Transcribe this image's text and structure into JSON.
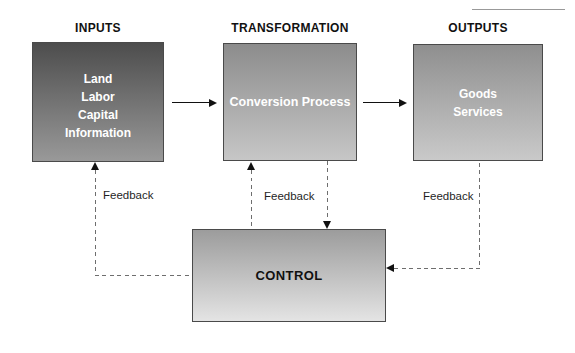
{
  "headers": {
    "inputs": "INPUTS",
    "transformation": "TRANSFORMATION",
    "outputs": "OUTPUTS"
  },
  "boxes": {
    "inputs": {
      "lines": [
        "Land",
        "Labor",
        "Capital",
        "Information"
      ]
    },
    "transformation": {
      "label": "Conversion Process"
    },
    "outputs": {
      "lines": [
        "Goods",
        "Services"
      ]
    },
    "control": {
      "label": "CONTROL"
    }
  },
  "feedback_labels": {
    "inputs": "Feedback",
    "transformation": "Feedback",
    "outputs": "Feedback"
  },
  "colors": {
    "page_bg": "#ffffff",
    "inputs_box_top": "#4d4d4d",
    "inputs_box_bottom": "#999999",
    "transformation_box_top": "#8c8c8c",
    "transformation_box_bottom": "#c6c6c6",
    "outputs_box_top": "#8f8f8f",
    "outputs_box_bottom": "#c9c9c9",
    "control_box_top": "#9c9c9c",
    "control_box_bottom": "#e4e4e4",
    "box_border": "#4a4a4a",
    "box_text": "#ffffff",
    "control_text": "#111111",
    "header_text": "#111111",
    "arrow": "#111111",
    "dashed_line": "#6e6e6e",
    "rule": "#999999"
  }
}
